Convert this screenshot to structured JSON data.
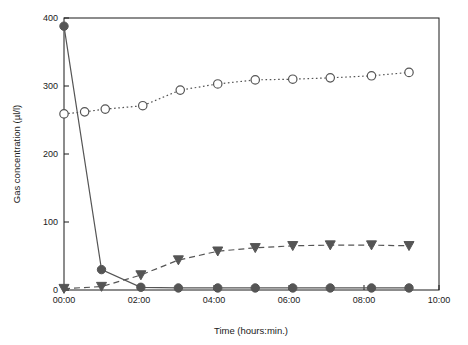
{
  "chart_data": {
    "type": "line",
    "title": "",
    "xlabel": "Time (hours:min.)",
    "ylabel": "Gas concentration (µl/l)",
    "xlim": [
      0,
      10
    ],
    "ylim": [
      0,
      400
    ],
    "ytick_labels": [
      "0",
      "100",
      "200",
      "300",
      "400"
    ],
    "ytick_values": [
      0,
      100,
      200,
      300,
      400
    ],
    "xtick_labels": [
      "00:00",
      "02:00",
      "04:00",
      "06:00",
      "08:00",
      "10:00"
    ],
    "xtick_values": [
      0,
      2,
      4,
      6,
      8,
      10
    ],
    "grid": false,
    "legend": "none",
    "series": [
      {
        "name": "open-circle-series",
        "marker": "open-circle",
        "line_style": "dotted",
        "color": "#555555",
        "x": [
          0.0,
          0.55,
          1.1,
          2.1,
          3.1,
          4.1,
          5.1,
          6.1,
          7.1,
          8.2,
          9.2
        ],
        "y": [
          259,
          262,
          266,
          271,
          294,
          303,
          309,
          310,
          312,
          315,
          320
        ]
      },
      {
        "name": "filled-circle-series",
        "marker": "filled-circle",
        "line_style": "solid",
        "color": "#555555",
        "x": [
          0.0,
          1.0,
          2.05,
          3.05,
          4.1,
          5.1,
          6.1,
          7.1,
          8.2,
          9.2
        ],
        "y": [
          388,
          30,
          4,
          3,
          3,
          3,
          3,
          3,
          3,
          3
        ]
      },
      {
        "name": "filled-triangle-series",
        "marker": "filled-triangle-down",
        "line_style": "dashed",
        "color": "#555555",
        "x": [
          0.0,
          1.0,
          2.05,
          3.05,
          4.1,
          5.1,
          6.1,
          7.1,
          8.2,
          9.2
        ],
        "y": [
          2,
          5,
          22,
          44,
          57,
          62,
          65,
          66,
          66,
          65
        ]
      }
    ]
  }
}
